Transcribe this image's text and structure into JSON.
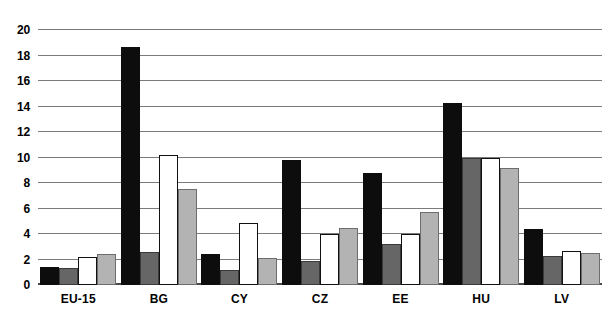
{
  "chart_data": {
    "type": "bar",
    "title": "",
    "subtitle": "",
    "xlabel": "",
    "ylabel": "",
    "ylim": [
      0,
      20
    ],
    "ytick_step": 2,
    "yticks": [
      "0",
      "2",
      "4",
      "6",
      "8",
      "10",
      "12",
      "14",
      "16",
      "18",
      "20"
    ],
    "grid": true,
    "legend": "none",
    "categories": [
      "EU-15",
      "BG",
      "CY",
      "CZ",
      "EE",
      "HU",
      "LV"
    ],
    "series": [
      {
        "name": "series-1",
        "color": "#0d0d0d",
        "values": [
          1.4,
          18.7,
          2.4,
          9.8,
          8.8,
          14.3,
          4.4
        ]
      },
      {
        "name": "series-2",
        "color": "#666666",
        "values": [
          1.3,
          2.6,
          1.2,
          1.9,
          3.2,
          10.0,
          2.3
        ]
      },
      {
        "name": "series-3",
        "color": "#ffffff",
        "values": [
          2.2,
          10.2,
          4.9,
          4.0,
          4.0,
          10.0,
          2.7
        ]
      },
      {
        "name": "series-4",
        "color": "#b3b3b3",
        "values": [
          2.4,
          7.5,
          2.1,
          4.5,
          5.7,
          9.2,
          2.5
        ]
      }
    ]
  },
  "colors": {
    "gridline": "#7b7b7b",
    "axis": "#4a4a4a",
    "background": "#ffffff",
    "text": "#000000"
  }
}
